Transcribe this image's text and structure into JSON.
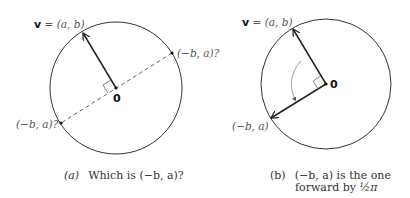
{
  "panel_a": {
    "vector_label_bold": "v",
    "vector_label_rest": " = (a, b)",
    "origin_label": "0",
    "candidate_upper": "(−b, a)?",
    "candidate_lower": "(−b, a)?",
    "caption_tag": "(a)",
    "caption_text": "Which is (−b, a)?"
  },
  "panel_b": {
    "vector_label_bold": "v",
    "vector_label_rest": " = (a, b)",
    "origin_label": "0",
    "rotated_label": "(−b, a)",
    "caption_tag": "(b)",
    "caption_line1": "(−b, a) is the one",
    "caption_line2_prefix": "forward by ",
    "caption_fraction": "½π"
  },
  "colors": {
    "line": "#222222",
    "text": "#555555",
    "arc": "#888888"
  }
}
